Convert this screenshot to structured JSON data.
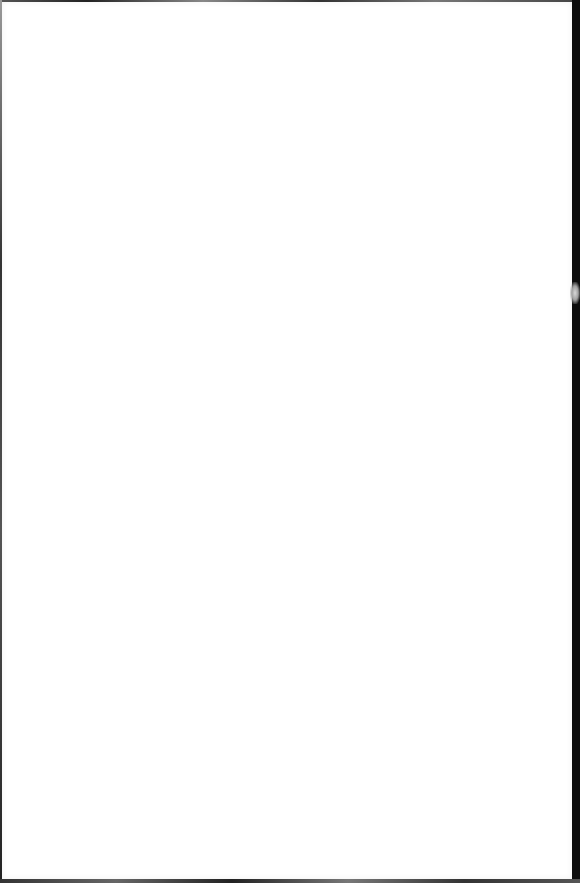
{
  "document": {
    "type": "blank-scanned-page",
    "text": "",
    "colors": {
      "page": "#ffffff",
      "border": "#111111"
    }
  }
}
